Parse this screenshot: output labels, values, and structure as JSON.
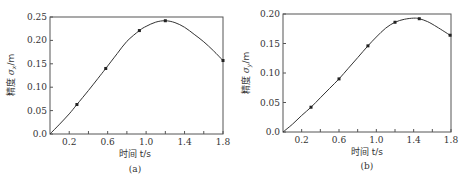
{
  "chart_data": [
    {
      "panel": "(a)",
      "type": "line",
      "title": "",
      "xlabel": "时间 t/s",
      "ylabel": "精度 σx/m",
      "xlim": [
        0,
        1.8
      ],
      "ylim": [
        0,
        0.25
      ],
      "xticks": [
        0.2,
        0.4,
        0.6,
        0.8,
        1.0,
        1.2,
        1.4,
        1.6,
        1.8
      ],
      "xtick_labels": [
        "0.2",
        "0.6",
        "1.0",
        "1.4",
        "1.8"
      ],
      "xtick_label_values": [
        0.2,
        0.6,
        1.0,
        1.4,
        1.8
      ],
      "yticks": [
        0.0,
        0.05,
        0.1,
        0.15,
        0.2,
        0.25
      ],
      "ytick_labels": [
        "0.0",
        "0.05",
        "0.10",
        "0.15",
        "0.20",
        "0.25"
      ],
      "grid": false,
      "series": [
        {
          "name": "σx",
          "markers": true,
          "x": [
            0.28,
            0.58,
            0.93,
            1.2,
            1.8
          ],
          "y": [
            0.063,
            0.14,
            0.221,
            0.242,
            0.157
          ]
        }
      ],
      "curve": {
        "x": [
          0.0,
          0.1,
          0.2,
          0.28,
          0.4,
          0.5,
          0.58,
          0.7,
          0.8,
          0.93,
          1.0,
          1.1,
          1.2,
          1.3,
          1.4,
          1.5,
          1.6,
          1.7,
          1.8
        ],
        "y": [
          0.0,
          0.021,
          0.043,
          0.063,
          0.093,
          0.119,
          0.14,
          0.172,
          0.198,
          0.221,
          0.23,
          0.239,
          0.242,
          0.238,
          0.228,
          0.213,
          0.197,
          0.178,
          0.157
        ]
      }
    },
    {
      "panel": "(b)",
      "type": "line",
      "title": "",
      "xlabel": "时间 t/s",
      "ylabel": "精度 σy/m",
      "xlim": [
        0,
        1.8
      ],
      "ylim": [
        0,
        0.2
      ],
      "xticks": [
        0.2,
        0.4,
        0.6,
        0.8,
        1.0,
        1.2,
        1.4,
        1.6,
        1.8
      ],
      "xtick_labels": [
        "0.2",
        "0.6",
        "1.0",
        "1.4",
        "1.8"
      ],
      "xtick_label_values": [
        0.2,
        0.6,
        1.0,
        1.4,
        1.8
      ],
      "yticks": [
        0.0,
        0.05,
        0.1,
        0.15,
        0.2
      ],
      "ytick_labels": [
        "0.0",
        "0.05",
        "0.10",
        "0.15",
        "0.20"
      ],
      "grid": false,
      "series": [
        {
          "name": "σy",
          "markers": true,
          "x": [
            0.3,
            0.6,
            0.91,
            1.2,
            1.46,
            1.79
          ],
          "y": [
            0.042,
            0.09,
            0.146,
            0.186,
            0.192,
            0.164
          ]
        }
      ],
      "curve": {
        "x": [
          0.0,
          0.1,
          0.2,
          0.3,
          0.4,
          0.5,
          0.6,
          0.7,
          0.8,
          0.91,
          1.0,
          1.1,
          1.2,
          1.3,
          1.4,
          1.46,
          1.55,
          1.65,
          1.79
        ],
        "y": [
          0.0,
          0.013,
          0.028,
          0.042,
          0.058,
          0.074,
          0.09,
          0.108,
          0.126,
          0.146,
          0.161,
          0.176,
          0.186,
          0.191,
          0.193,
          0.192,
          0.187,
          0.178,
          0.164
        ]
      }
    }
  ],
  "panels": {
    "a": {
      "caption": "(a)",
      "xlabel": "时间 t/s",
      "ylabel_prefix": "精度 ",
      "ylabel_sym": "σ",
      "ylabel_sub": "x",
      "ylabel_unit": "/m"
    },
    "b": {
      "caption": "(b)",
      "xlabel": "时间 t/s",
      "ylabel_prefix": "精度 ",
      "ylabel_sym": "σ",
      "ylabel_sub": "y",
      "ylabel_unit": "/m"
    }
  },
  "colors": {
    "line": "#333333",
    "axis": "#555555",
    "marker": "#222222"
  }
}
